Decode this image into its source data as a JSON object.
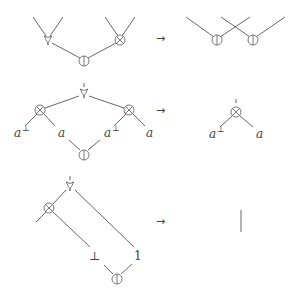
{
  "diagram": {
    "title": "",
    "rewrite_rules": [
      {
        "name": "tensor-par-cut commutation",
        "lhs": {
          "nodes": [
            "par",
            "cut",
            "tensor"
          ],
          "description": "par and tensor connected by a cut"
        },
        "arrow": "→",
        "rhs": {
          "nodes": [
            "cut",
            "cut"
          ],
          "description": "two cuts with crossed wires"
        }
      },
      {
        "name": "eta-expansion reduction",
        "lhs": {
          "nodes": [
            "par",
            "tensor",
            "tensor",
            "cut"
          ],
          "labels": [
            "a",
            "⊥",
            "a",
            "a",
            "⊥",
            "a"
          ]
        },
        "arrow": "→",
        "rhs": {
          "nodes": [
            "tensor"
          ],
          "labels": [
            "a",
            "⊥",
            "a"
          ]
        }
      },
      {
        "name": "unit reduction",
        "lhs": {
          "nodes": [
            "par",
            "tensor",
            "cut"
          ],
          "labels": [
            "⊥",
            "1"
          ]
        },
        "arrow": "→",
        "rhs": {
          "nodes": [
            "wire"
          ]
        }
      }
    ],
    "symbols": {
      "par": "⅋",
      "tensor": "⊗",
      "cut": "⦶",
      "arrow": "→",
      "a": "a",
      "perp": "⊥",
      "bottom": "⊥",
      "one": "1"
    },
    "colors": {
      "ink": "#555555",
      "background": "#ffffff"
    }
  }
}
